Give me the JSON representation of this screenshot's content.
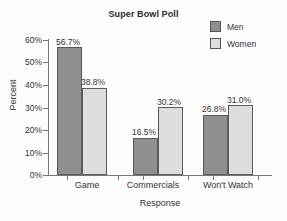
{
  "chart_data": {
    "type": "bar",
    "title": "Super Bowl Poll",
    "xlabel": "Response",
    "ylabel": "Percent",
    "categories": [
      "Game",
      "Commercials",
      "Won't Watch"
    ],
    "series": [
      {
        "name": "Men",
        "color": "#8f8f8f",
        "values": [
          56.7,
          16.5,
          26.8
        ],
        "labels": [
          "56.7%",
          "16.5%",
          "26.8%"
        ]
      },
      {
        "name": "Women",
        "color": "#dddddd",
        "values": [
          38.8,
          30.2,
          31.0
        ],
        "labels": [
          "38.8%",
          "30.2%",
          "31.0%"
        ]
      }
    ],
    "ylim": [
      0,
      60
    ],
    "ytick_values": [
      60,
      50,
      40,
      30,
      20,
      10,
      0
    ],
    "ytick_labels": [
      "60%",
      "50%",
      "40%",
      "30%",
      "20%",
      "10%",
      "0%"
    ],
    "grid": false,
    "legend_position": "top-right",
    "legend_entries": [
      "Men",
      "Women"
    ]
  }
}
